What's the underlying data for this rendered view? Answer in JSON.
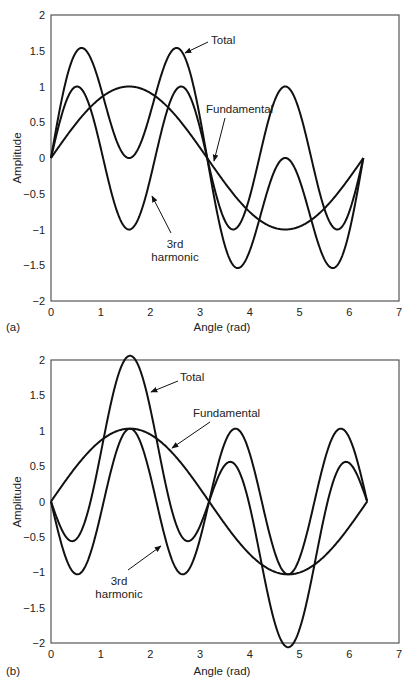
{
  "figure": {
    "panels": [
      "(a)",
      "(b)"
    ]
  },
  "chart_data": [
    {
      "type": "line",
      "panel_label": "(a)",
      "title": "",
      "xlabel": "Angle (rad)",
      "ylabel": "Amplitude",
      "xlim": [
        0,
        7
      ],
      "ylim": [
        -2,
        2
      ],
      "xticks": [
        "0",
        "1",
        "2",
        "3",
        "4",
        "5",
        "6",
        "7"
      ],
      "yticks": [
        "2",
        "1.5",
        "1",
        "0.5",
        "0",
        "−0.5",
        "−1",
        "−1.5",
        "−2"
      ],
      "grid": false,
      "legend": "none (inline annotations with arrows)",
      "x_end": 6.283,
      "x": [
        0,
        0.262,
        0.524,
        0.785,
        1.047,
        1.309,
        1.571,
        1.833,
        2.094,
        2.356,
        2.618,
        2.88,
        3.142,
        3.403,
        3.665,
        3.927,
        4.189,
        4.451,
        4.712,
        4.974,
        5.236,
        5.498,
        5.76,
        6.021,
        6.283
      ],
      "series": [
        {
          "name": "Fundamental",
          "formula": "sin(x)",
          "amp": 1,
          "harmonic": 1,
          "sign": 1,
          "values": [
            0,
            0.259,
            0.5,
            0.707,
            0.866,
            0.966,
            1,
            0.966,
            0.866,
            0.707,
            0.5,
            0.259,
            0,
            -0.259,
            -0.5,
            -0.707,
            -0.866,
            -0.966,
            -1,
            -0.966,
            -0.866,
            -0.707,
            -0.5,
            -0.259,
            0
          ]
        },
        {
          "name": "3rd harmonic",
          "formula": "sin(3x)",
          "amp": 1,
          "harmonic": 3,
          "sign": 1,
          "values": [
            0,
            0.707,
            1,
            0.707,
            0,
            -0.707,
            -1,
            -0.707,
            0,
            0.707,
            1,
            0.707,
            0,
            -0.707,
            -1,
            -0.707,
            0,
            0.707,
            1,
            0.707,
            0,
            -0.707,
            -1,
            -0.707,
            0
          ]
        },
        {
          "name": "Total",
          "formula": "sin(x)+sin(3x)",
          "values": [
            0,
            0.966,
            1.5,
            1.414,
            0.866,
            0.259,
            0,
            0.259,
            0.866,
            1.414,
            1.5,
            0.966,
            0,
            -0.966,
            -1.5,
            -1.414,
            -0.866,
            -0.259,
            0,
            -0.259,
            -0.866,
            -1.414,
            -1.5,
            -0.966,
            0
          ]
        }
      ],
      "annotations": [
        {
          "text": "Total",
          "lines": [
            "Total"
          ]
        },
        {
          "text": "Fundamental",
          "lines": [
            "Fundamental"
          ]
        },
        {
          "text": "3rd harmonic",
          "lines": [
            "3rd",
            "harmonic"
          ]
        }
      ]
    },
    {
      "type": "line",
      "panel_label": "(b)",
      "title": "",
      "xlabel": "Angle (rad)",
      "ylabel": "Amplitude",
      "xlim": [
        0,
        7
      ],
      "ylim": [
        -2,
        2
      ],
      "xticks": [
        "0",
        "1",
        "2",
        "3",
        "4",
        "5",
        "6",
        "7"
      ],
      "yticks": [
        "2",
        "1.5",
        "1",
        "0.5",
        "0",
        "−0.5",
        "−1",
        "−1.5",
        "−2"
      ],
      "grid": false,
      "legend": "none (inline annotations with arrows)",
      "x_end": 6.36,
      "x": [
        0,
        0.262,
        0.524,
        0.785,
        1.047,
        1.309,
        1.571,
        1.833,
        2.094,
        2.356,
        2.618,
        2.88,
        3.142,
        3.403,
        3.665,
        3.927,
        4.189,
        4.451,
        4.712,
        4.974,
        5.236,
        5.498,
        5.76,
        6.021,
        6.283
      ],
      "series": [
        {
          "name": "Fundamental",
          "formula": "sin(x)",
          "amp": 1.03,
          "harmonic": 1,
          "sign": 1,
          "values": [
            0,
            0.259,
            0.5,
            0.707,
            0.866,
            0.966,
            1,
            0.966,
            0.866,
            0.707,
            0.5,
            0.259,
            0,
            -0.259,
            -0.5,
            -0.707,
            -0.866,
            -0.966,
            -1,
            -0.966,
            -0.866,
            -0.707,
            -0.5,
            -0.259,
            0
          ]
        },
        {
          "name": "3rd harmonic",
          "formula": "-sin(3x)",
          "amp": 1.03,
          "harmonic": 3,
          "sign": -1,
          "values": [
            0,
            -0.707,
            -1,
            -0.707,
            0,
            0.707,
            1,
            0.707,
            0,
            -0.707,
            -1,
            -0.707,
            0,
            0.707,
            1,
            0.707,
            0,
            -0.707,
            -1,
            -0.707,
            0,
            0.707,
            1,
            0.707,
            0
          ]
        },
        {
          "name": "Total",
          "formula": "sin(x)-sin(3x)",
          "values": [
            0,
            -0.448,
            -0.5,
            0,
            0.866,
            1.673,
            2,
            1.673,
            0.866,
            0,
            -0.5,
            -0.448,
            0,
            0.448,
            0.5,
            0,
            -0.866,
            -1.673,
            -2,
            -1.673,
            -0.866,
            0,
            0.5,
            0.448,
            0
          ]
        }
      ],
      "annotations": [
        {
          "text": "Total",
          "lines": [
            "Total"
          ]
        },
        {
          "text": "Fundamental",
          "lines": [
            "Fundamental"
          ]
        },
        {
          "text": "3rd harmonic",
          "lines": [
            "3rd",
            "harmonic"
          ]
        }
      ]
    }
  ]
}
